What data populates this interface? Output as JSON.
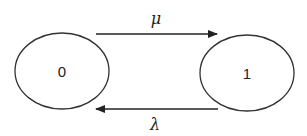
{
  "diagram": {
    "type": "state-transition",
    "states": [
      {
        "id": "state-0",
        "label": "0"
      },
      {
        "id": "state-1",
        "label": "1"
      }
    ],
    "transitions": [
      {
        "from": "0",
        "to": "1",
        "label": "μ"
      },
      {
        "from": "1",
        "to": "0",
        "label": "λ"
      }
    ],
    "colors": {
      "stroke": "#333333",
      "background": "#ffffff"
    }
  }
}
